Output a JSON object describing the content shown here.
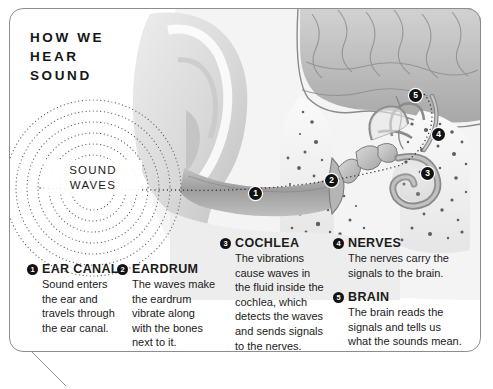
{
  "poster": {
    "title": "HOW WE\nHEAR\nSOUND",
    "sound_waves_label": "SOUND\nWAVES",
    "colors": {
      "frame_border": "#8d8d8d",
      "marker_fill": "#121212",
      "marker_text": "#ffffff",
      "text": "#1b1b1b",
      "background": "#ffffff",
      "ear_light": "#e3e3e3",
      "ear_mid": "#c9c9c9",
      "ear_dark": "#8f8f8f",
      "canal_shadow": "#9a9a9a",
      "brain_grey": "#b9b9b9"
    }
  },
  "markers": [
    {
      "id": "1",
      "name": "marker-ear-canal",
      "x": 249,
      "y": 187
    },
    {
      "id": "2",
      "name": "marker-eardrum",
      "x": 325,
      "y": 174
    },
    {
      "id": "3",
      "name": "marker-cochlea",
      "x": 421,
      "y": 167
    },
    {
      "id": "4",
      "name": "marker-nerves",
      "x": 432,
      "y": 128
    },
    {
      "id": "5",
      "name": "marker-brain",
      "x": 409,
      "y": 89
    }
  ],
  "steps": [
    {
      "num": "1",
      "title": "EAR CANAL",
      "body": "Sound enters\nthe ear and\ntravels through\nthe ear canal."
    },
    {
      "num": "2",
      "title": "EARDRUM",
      "body": "The waves make\nthe eardrum\nvibrate along\nwith the bones\nnext to it."
    },
    {
      "num": "3",
      "title": "COCHLEA",
      "body": "The vibrations\ncause waves in\nthe fluid inside the\ncochlea, which\ndetects the waves\nand sends signals\nto the nerves."
    },
    {
      "num": "4",
      "title": "NERVES",
      "body": "The nerves carry the\nsignals to the brain."
    },
    {
      "num": "5",
      "title": "BRAIN",
      "body": "The brain reads the\nsignals and tells us\nwhat the sounds mean."
    }
  ]
}
